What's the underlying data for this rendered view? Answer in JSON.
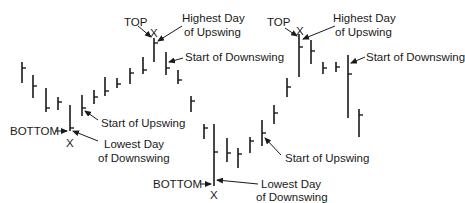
{
  "chart_data": {
    "type": "bar",
    "subtype": "ohlc-price-bars (high-low with close tick)",
    "title": "",
    "xlabel": "",
    "ylabel": "",
    "grid": false,
    "legend": null,
    "bars": [
      {
        "x": 22,
        "high": 62,
        "low": 83,
        "close": 68
      },
      {
        "x": 33,
        "high": 75,
        "low": 98,
        "close": 86
      },
      {
        "x": 46,
        "high": 88,
        "low": 112,
        "close": 108
      },
      {
        "x": 58,
        "high": 97,
        "low": 110,
        "close": 102
      },
      {
        "x": 70,
        "high": 105,
        "low": 131,
        "close": 128
      },
      {
        "x": 82,
        "high": 95,
        "low": 116,
        "close": 108
      },
      {
        "x": 94,
        "high": 90,
        "low": 104,
        "close": 97
      },
      {
        "x": 105,
        "high": 77,
        "low": 96,
        "close": 91
      },
      {
        "x": 117,
        "high": 78,
        "low": 88,
        "close": 84
      },
      {
        "x": 130,
        "high": 68,
        "low": 84,
        "close": 73
      },
      {
        "x": 143,
        "high": 57,
        "low": 74,
        "close": 70
      },
      {
        "x": 154,
        "high": 38,
        "low": 62,
        "close": 43
      },
      {
        "x": 166,
        "high": 52,
        "low": 75,
        "close": 68
      },
      {
        "x": 178,
        "high": 70,
        "low": 84,
        "close": 80
      },
      {
        "x": 191,
        "high": 96,
        "low": 112,
        "close": 101
      },
      {
        "x": 204,
        "high": 124,
        "low": 139,
        "close": 128
      },
      {
        "x": 214,
        "high": 124,
        "low": 186,
        "close": 152
      },
      {
        "x": 227,
        "high": 138,
        "low": 162,
        "close": 153
      },
      {
        "x": 238,
        "high": 148,
        "low": 168,
        "close": 154
      },
      {
        "x": 250,
        "high": 137,
        "low": 153,
        "close": 141
      },
      {
        "x": 262,
        "high": 120,
        "low": 146,
        "close": 133
      },
      {
        "x": 274,
        "high": 105,
        "low": 124,
        "close": 113
      },
      {
        "x": 287,
        "high": 78,
        "low": 97,
        "close": 87
      },
      {
        "x": 299,
        "high": 34,
        "low": 77,
        "close": 47
      },
      {
        "x": 311,
        "high": 40,
        "low": 64,
        "close": 51
      },
      {
        "x": 323,
        "high": 62,
        "low": 74,
        "close": 68
      },
      {
        "x": 336,
        "high": 62,
        "low": 72,
        "close": 67
      },
      {
        "x": 348,
        "high": 55,
        "low": 118,
        "close": 74
      },
      {
        "x": 359,
        "high": 109,
        "low": 137,
        "close": 115
      }
    ],
    "annotations": [
      {
        "text": "TOP",
        "target_bar": 11
      },
      {
        "text": "X",
        "target_bar": 11
      },
      {
        "text": "Highest Day of Upswing",
        "target_bar": 11
      },
      {
        "text": "Start of Downswing",
        "target_bar": 12
      },
      {
        "text": "Start of Upswing",
        "target_bar": 5
      },
      {
        "text": "BOTTOM",
        "target_bar": 4
      },
      {
        "text": "X",
        "target_bar": 4
      },
      {
        "text": "Lowest Day of Downswing",
        "target_bar": 4
      },
      {
        "text": "TOP",
        "target_bar": 23
      },
      {
        "text": "X",
        "target_bar": 23
      },
      {
        "text": "Highest Day of Upswing",
        "target_bar": 23
      },
      {
        "text": "Start of Downswing",
        "target_bar": 27
      },
      {
        "text": "Start of Upswing",
        "target_bar": 20
      },
      {
        "text": "BOTTOM",
        "target_bar": 16
      },
      {
        "text": "X",
        "target_bar": 16
      },
      {
        "text": "Lowest Day of Downswing",
        "target_bar": 16
      }
    ]
  },
  "colors": {
    "bar": "#1a1a1a",
    "text": "#1a1a1a",
    "background": "#ffffff"
  },
  "labels": {
    "left": {
      "top": "TOP",
      "top_x": "X",
      "highest_line1": "Highest Day",
      "highest_line2": "of Upswing",
      "start_downswing": "Start of Downswing",
      "start_upswing": "Start of Upswing",
      "bottom": "BOTTOM",
      "bottom_x": "X",
      "lowest_line1": "Lowest Day",
      "lowest_line2": "of Downswing"
    },
    "right": {
      "top": "TOP",
      "top_x": "X",
      "highest_line1": "Highest Day",
      "highest_line2": "of Upswing",
      "start_downswing": "Start of Downswing",
      "start_upswing": "Start of Upswing",
      "bottom": "BOTTOM",
      "bottom_x": "X",
      "lowest_line1": "Lowest Day",
      "lowest_line2": "of Downswing"
    }
  }
}
